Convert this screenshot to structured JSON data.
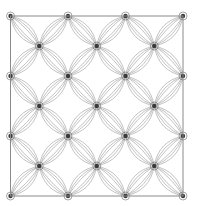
{
  "diagram": {
    "type": "geometric-pattern",
    "frame": {
      "x": 10.5,
      "y": 16,
      "width": 172.5,
      "height": 180,
      "stroke": "#8a8a8a"
    },
    "grid": {
      "cols": 3,
      "rows": 3,
      "origin_x": 10.5,
      "origin_y": 16,
      "dx": 57.5,
      "dy": 60
    },
    "petal": {
      "curves_per_side": 3,
      "max_bulge": 0.34,
      "stroke": "#9a9a9a",
      "stroke_width": 0.6
    },
    "node": {
      "radius": 2.2,
      "fill": "#3a3a3a",
      "ring_radius": 4,
      "ring_stroke": "#6a6a6a"
    },
    "colors": {
      "background": "#ffffff",
      "line": "#9a9a9a",
      "node": "#333333",
      "frame": "#8a8a8a"
    }
  }
}
